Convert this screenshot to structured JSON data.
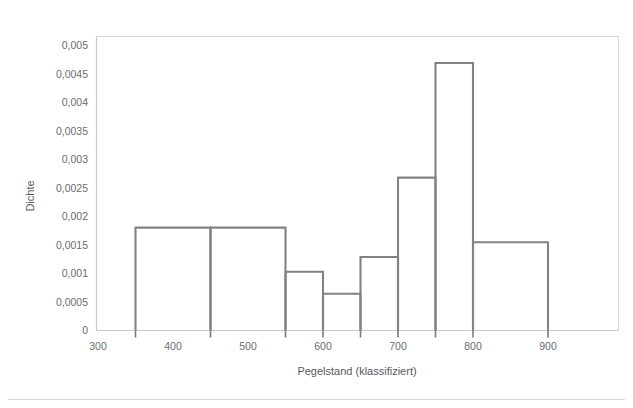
{
  "chart_data": {
    "type": "bar",
    "title": "",
    "subtitle": "",
    "xlabel": "Pegelstand (klassifiziert)",
    "ylabel": "Dichte",
    "xlim": [
      300,
      950
    ],
    "ylim": [
      0,
      0.005
    ],
    "grid": false,
    "legend": null,
    "x_tick_labels": [
      "300",
      "400",
      "500",
      "600",
      "700",
      "800",
      "900"
    ],
    "x_tick_values": [
      300,
      400,
      500,
      600,
      700,
      800,
      900
    ],
    "x_tick_marks": [
      350,
      450,
      550,
      600,
      650,
      700,
      750,
      800,
      900
    ],
    "y_tick_labels": [
      "0",
      "0,0005",
      "0,001",
      "0,0015",
      "0,002",
      "0,0025",
      "0,003",
      "0,0035",
      "0,004",
      "0,0045",
      "0,005"
    ],
    "y_tick_values": [
      0,
      0.0005,
      0.001,
      0.0015,
      0.002,
      0.0025,
      0.003,
      0.0035,
      0.004,
      0.0045,
      0.005
    ],
    "decimal_separator": ",",
    "bins": [
      {
        "label": "350-450",
        "x0": 350,
        "x1": 450,
        "value": 0.00175,
        "value_label": "0,00175"
      },
      {
        "label": "450-550",
        "x0": 450,
        "x1": 550,
        "value": 0.00175,
        "value_label": "0,00175"
      },
      {
        "label": "550-600",
        "x0": 550,
        "x1": 600,
        "value": 0.001,
        "value_label": "0,001"
      },
      {
        "label": "600-650",
        "x0": 600,
        "x1": 650,
        "value": 0.000625,
        "value_label": "0,000625"
      },
      {
        "label": "650-700",
        "x0": 650,
        "x1": 700,
        "value": 0.00125,
        "value_label": "0,00125"
      },
      {
        "label": "700-750",
        "x0": 700,
        "x1": 750,
        "value": 0.0026,
        "value_label": "0,0026"
      },
      {
        "label": "750-800",
        "x0": 750,
        "x1": 800,
        "value": 0.00455,
        "value_label": "0,00455"
      },
      {
        "label": "800-900",
        "x0": 800,
        "x1": 900,
        "value": 0.0015,
        "value_label": "0,0015"
      }
    ],
    "categories": [
      "350-450",
      "450-550",
      "550-600",
      "600-650",
      "650-700",
      "700-750",
      "750-800",
      "800-900"
    ],
    "values": [
      0.00175,
      0.00175,
      0.001,
      0.000625,
      0.00125,
      0.0026,
      0.00455,
      0.0015
    ],
    "colors": {
      "bar_outline": "#808285",
      "bar_fill": "none",
      "axis": "#c9c9c9",
      "frame": "#d9d9d9",
      "text": "#58595b",
      "background": "#ffffff"
    }
  }
}
